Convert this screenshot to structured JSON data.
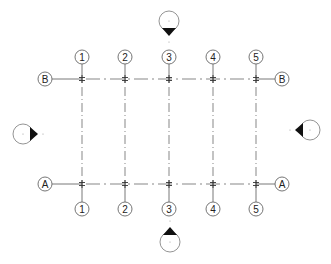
{
  "diagram": {
    "type": "structural-grid-plan",
    "colors": {
      "background": "#ffffff",
      "line": "#555555",
      "bubble_stroke": "#666666",
      "marker_fill": "#111111",
      "marker_circle": "#888888"
    },
    "vertical_grids": [
      {
        "label": "1",
        "x": 82
      },
      {
        "label": "2",
        "x": 125
      },
      {
        "label": "3",
        "x": 169
      },
      {
        "label": "4",
        "x": 213
      },
      {
        "label": "5",
        "x": 256
      }
    ],
    "horizontal_grids": [
      {
        "label": "B",
        "y": 79
      },
      {
        "label": "A",
        "y": 184
      }
    ],
    "grid_extents": {
      "top_bubble_y": 57,
      "bottom_bubble_y": 209,
      "left_bubble_x": 45,
      "right_bubble_x": 282,
      "bubble_radius": 7
    },
    "elevation_markers": [
      {
        "id": "north",
        "cx": 169,
        "cy": 21,
        "direction": "down"
      },
      {
        "id": "south",
        "cx": 170,
        "cy": 242,
        "direction": "up"
      },
      {
        "id": "west",
        "cx": 23,
        "cy": 134,
        "direction": "right"
      },
      {
        "id": "east",
        "cx": 310,
        "cy": 130,
        "direction": "left"
      }
    ]
  }
}
